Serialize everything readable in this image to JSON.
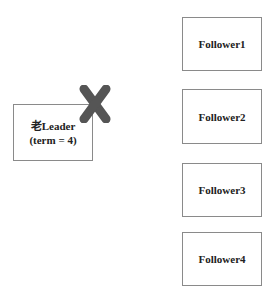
{
  "leader": {
    "line1": "老Leader",
    "line2": "(term = 4)",
    "status_icon": "cross-icon",
    "status_color": "#555555"
  },
  "followers": [
    {
      "label": "Follower1"
    },
    {
      "label": "Follower2"
    },
    {
      "label": "Follower3"
    },
    {
      "label": "Follower4"
    }
  ]
}
